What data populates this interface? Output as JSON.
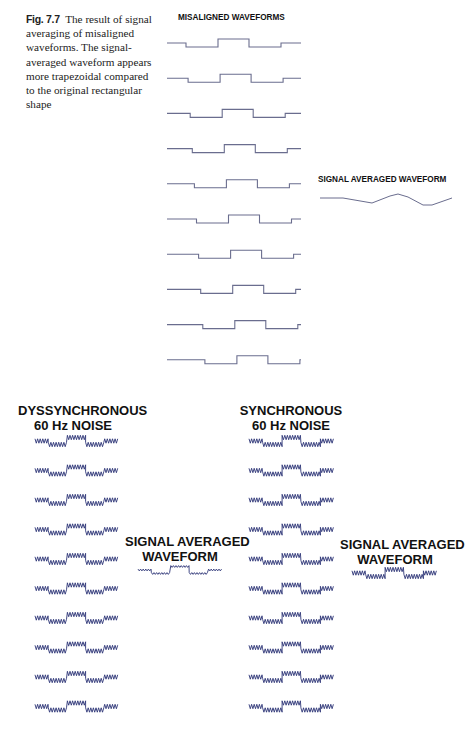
{
  "caption": {
    "label": "Fig. 7.7",
    "text": "The result of signal averaging of misaligned waveforms. The signal-averaged waveform appears more trapezoidal compared to the original rectangular shape"
  },
  "top_panel": {
    "misaligned_title": "MISALIGNED WAVEFORMS",
    "averaged_title": "SIGNAL AVERAGED WAVEFORM",
    "waveform_color": "#6a6d8e",
    "waveform_count": 10
  },
  "bottom_left_panel": {
    "title_line1": "DYSSYNCHRONOUS",
    "title_line2": "60 Hz NOISE",
    "averaged_title_line1": "SIGNAL AVERAGED",
    "averaged_title_line2": "WAVEFORM",
    "waveform_count": 10
  },
  "bottom_right_panel": {
    "title_line1": "SYNCHRONOUS",
    "title_line2": "60 Hz NOISE",
    "averaged_title_line1": "SIGNAL AVERAGED",
    "averaged_title_line2": "WAVEFORM",
    "waveform_count": 10
  },
  "colors": {
    "clean_waveform": "#6a6d8e",
    "noisy_waveform": "#2e3577",
    "text": "#111111"
  }
}
